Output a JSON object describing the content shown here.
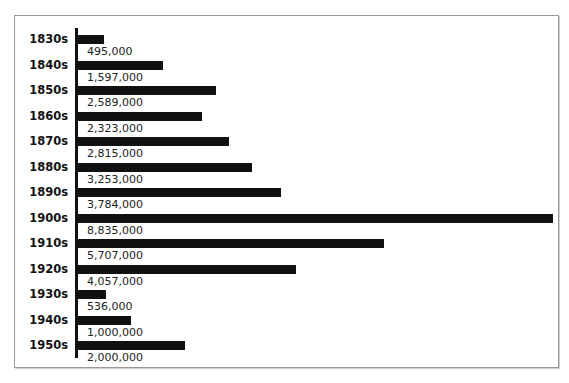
{
  "chart_data": {
    "type": "bar",
    "orientation": "horizontal",
    "title": "",
    "xlabel": "",
    "ylabel": "",
    "grid": false,
    "categories": [
      "1830s",
      "1840s",
      "1850s",
      "1860s",
      "1870s",
      "1880s",
      "1890s",
      "1900s",
      "1910s",
      "1920s",
      "1930s",
      "1940s",
      "1950s"
    ],
    "values": [
      495000,
      1597000,
      2589000,
      2323000,
      2815000,
      3253000,
      3784000,
      8835000,
      5707000,
      4057000,
      536000,
      1000000,
      2000000
    ],
    "labels": [
      "495,000",
      "1,597,000",
      "2,589,000",
      "2,323,000",
      "2,815,000",
      "3,253,000",
      "3,784,000",
      "8,835,000",
      "5,707,000",
      "4,057,000",
      "536,000",
      "1,000,000",
      "2,000,000"
    ],
    "xlim": [
      0,
      8835000
    ],
    "bar_color": "#111111"
  }
}
